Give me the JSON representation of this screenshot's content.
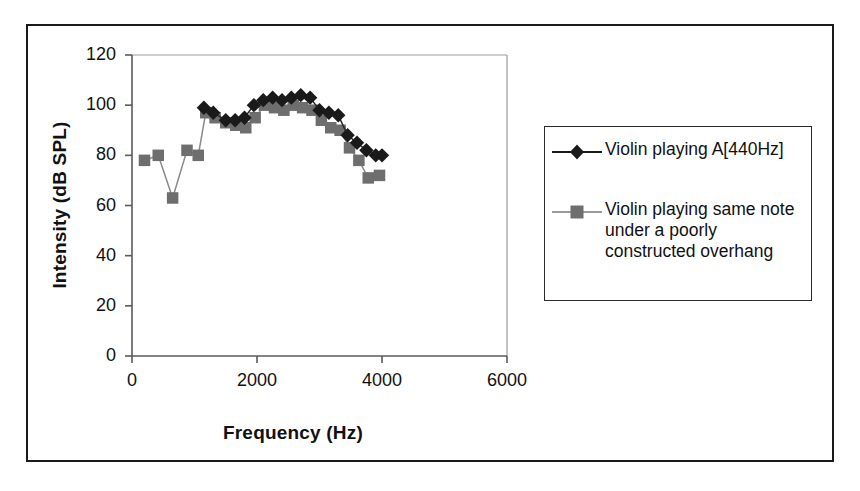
{
  "chart_data": {
    "type": "line",
    "title": "",
    "xlabel": "Frequency (Hz)",
    "ylabel": "Intensity (dB SPL)",
    "xlim": [
      0,
      6000
    ],
    "ylim": [
      0,
      120
    ],
    "xticks": [
      0,
      2000,
      4000,
      6000
    ],
    "yticks": [
      0,
      20,
      40,
      60,
      80,
      100,
      120
    ],
    "grid": false,
    "legend_position": "right",
    "series": [
      {
        "name": "Violin playing A[440Hz]",
        "marker": "diamond",
        "color": "#1a1a1a",
        "x": [
          1150,
          1300,
          1500,
          1650,
          1800,
          1950,
          2100,
          2250,
          2400,
          2550,
          2700,
          2850,
          3000,
          3150,
          3300,
          3450,
          3600,
          3750,
          3900,
          4000
        ],
        "y": [
          99,
          97,
          94,
          94,
          95,
          100,
          102,
          103,
          102,
          103,
          104,
          103,
          98,
          97,
          96,
          88,
          85,
          82,
          80,
          80
        ]
      },
      {
        "name": "Violin playing same note under a poorly constructed overhang",
        "marker": "square",
        "color": "#6e6e6e",
        "x": [
          200,
          420,
          650,
          880,
          1060,
          1180,
          1330,
          1500,
          1660,
          1820,
          1970,
          2120,
          2280,
          2430,
          2580,
          2730,
          2880,
          3030,
          3180,
          3330,
          3480,
          3630,
          3780,
          3960
        ],
        "y": [
          78,
          80,
          63,
          82,
          80,
          97,
          95,
          93,
          92,
          91,
          95,
          100,
          99,
          98,
          100,
          99,
          98,
          94,
          91,
          90,
          83,
          78,
          71,
          72
        ]
      }
    ]
  },
  "legend": {
    "entries": [
      {
        "label": "Violin playing A[440Hz]",
        "marker": "diamond-marker",
        "color": "#1a1a1a"
      },
      {
        "label": "Violin playing same note under a poorly constructed overhang",
        "marker": "square-marker",
        "color": "#6e6e6e"
      }
    ]
  },
  "colors": {
    "series_a": "#1a1a1a",
    "series_b": "#6e6e6e",
    "axis": "#555555",
    "frame": "#1a1a1a",
    "background": "#ffffff"
  }
}
